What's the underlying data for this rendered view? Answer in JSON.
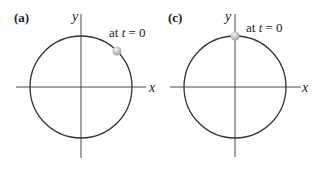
{
  "panels": [
    {
      "label": "(a)",
      "x_axis": "x",
      "y_axis": "y",
      "annotation_prefix": "at ",
      "annotation_var": "t",
      "annotation_suffix": " = 0",
      "start_position": "upper-right of circle (~45°)"
    },
    {
      "label": "(c)",
      "x_axis": "x",
      "y_axis": "y",
      "annotation_prefix": "at ",
      "annotation_var": "t",
      "annotation_suffix": " = 0",
      "start_position": "top of circle (90°)"
    }
  ],
  "colors": {
    "line": "#333333",
    "ball": "#b8b8b8",
    "ball_highlight": "#eeeeee"
  }
}
